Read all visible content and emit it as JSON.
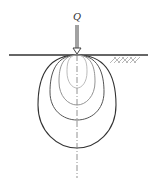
{
  "diagram": {
    "load_label": "Q",
    "colors": {
      "ground": "#333333",
      "outer_bulb": "#333333",
      "mid_bulb": "#555555",
      "inner_bulb": "#888888",
      "innermost_bulb": "#aaaaaa",
      "axis": "#777777",
      "hatch": "#999999"
    }
  }
}
